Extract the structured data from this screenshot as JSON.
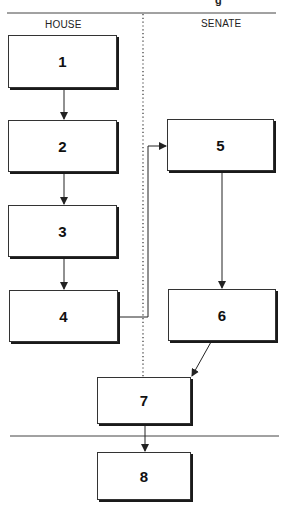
{
  "header": {
    "partial_text": "g"
  },
  "lanes": {
    "left_label": "HOUSE",
    "right_label": "SENATE"
  },
  "boxes": [
    {
      "id": "1",
      "label": "1",
      "lane": "house"
    },
    {
      "id": "2",
      "label": "2",
      "lane": "house"
    },
    {
      "id": "3",
      "label": "3",
      "lane": "house"
    },
    {
      "id": "4",
      "label": "4",
      "lane": "house"
    },
    {
      "id": "5",
      "label": "5",
      "lane": "senate"
    },
    {
      "id": "6",
      "label": "6",
      "lane": "senate"
    },
    {
      "id": "7",
      "label": "7",
      "lane": "joint"
    },
    {
      "id": "8",
      "label": "8",
      "lane": "final"
    }
  ],
  "edges": [
    {
      "from": "1",
      "to": "2"
    },
    {
      "from": "2",
      "to": "3"
    },
    {
      "from": "3",
      "to": "4"
    },
    {
      "from": "4",
      "to": "5"
    },
    {
      "from": "5",
      "to": "6"
    },
    {
      "from": "6",
      "to": "7"
    },
    {
      "from": "7",
      "to": "8"
    }
  ],
  "colors": {
    "line": "#333333",
    "shadow": "#1a1a1a",
    "background": "#ffffff"
  }
}
